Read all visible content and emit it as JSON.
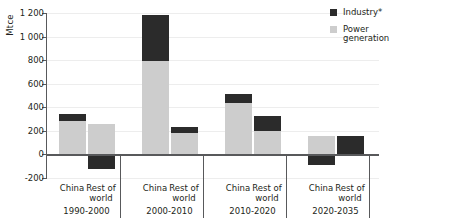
{
  "chart_data": {
    "type": "bar",
    "title": "",
    "subtitle": "",
    "xlabel": "",
    "ylabel": "Mtce",
    "ylim": [
      -200,
      1200
    ],
    "ytick_values": [
      -200,
      0,
      200,
      400,
      600,
      800,
      1000,
      1200
    ],
    "ytick_labels": [
      "-200",
      "0",
      "200",
      "400",
      "600",
      "800",
      "1 000",
      "1 200"
    ],
    "grid": true,
    "stacked": true,
    "legend_position": "top-right",
    "legend": [
      "Industry*",
      "Power generation"
    ],
    "colors": {
      "industry": "#2b2b2b",
      "power_generation": "#cdcdcd",
      "axis": "#58595b",
      "gridline": "#ededed",
      "background": "#ffffff"
    },
    "series": [
      {
        "name": "Power generation",
        "color": "#cdcdcd",
        "values": [
          280,
          255,
          790,
          185,
          440,
          200,
          160,
          0
        ]
      },
      {
        "name": "Industry*",
        "color": "#2b2b2b",
        "values": [
          60,
          -125,
          390,
          50,
          70,
          130,
          -90,
          160
        ]
      }
    ],
    "categories": [
      "China",
      "Rest of world",
      "China",
      "Rest of world",
      "China",
      "Rest of world",
      "China",
      "Rest of world"
    ],
    "groups": [
      {
        "period": "1990-2000",
        "bars": [
          {
            "label": "China",
            "power_generation": 280,
            "industry": 60,
            "total": 340
          },
          {
            "label": "Rest of world",
            "power_generation": 255,
            "industry": -125,
            "total": 130
          }
        ]
      },
      {
        "period": "2000-2010",
        "bars": [
          {
            "label": "China",
            "power_generation": 790,
            "industry": 390,
            "total": 1180
          },
          {
            "label": "Rest of world",
            "power_generation": 185,
            "industry": 50,
            "total": 235
          }
        ]
      },
      {
        "period": "2010-2020",
        "bars": [
          {
            "label": "China",
            "power_generation": 440,
            "industry": 70,
            "total": 510
          },
          {
            "label": "Rest of world",
            "power_generation": 200,
            "industry": 130,
            "total": 330
          }
        ]
      },
      {
        "period": "2020-2035",
        "bars": [
          {
            "label": "China",
            "power_generation": 160,
            "industry": -90,
            "total": 70
          },
          {
            "label": "Rest of world",
            "power_generation": 0,
            "industry": 160,
            "total": 160
          }
        ]
      }
    ]
  },
  "axis": {
    "y_title": "Mtce",
    "ticks": [
      {
        "value": 1200,
        "label": "1 200"
      },
      {
        "value": 1000,
        "label": "1 000"
      },
      {
        "value": 800,
        "label": "800"
      },
      {
        "value": 600,
        "label": "600"
      },
      {
        "value": 400,
        "label": "400"
      },
      {
        "value": 200,
        "label": "200"
      },
      {
        "value": 0,
        "label": "0"
      },
      {
        "value": -200,
        "label": "-200"
      }
    ]
  },
  "legend": {
    "items": [
      {
        "label": "Industry*",
        "color": "#2b2b2b"
      },
      {
        "label": "Power generation",
        "color": "#cdcdcd",
        "line1": "Power",
        "line2": "generation"
      }
    ]
  },
  "category_labels": {
    "china": "China",
    "rest_of_world_line1": "Rest of",
    "rest_of_world_line2": "world"
  },
  "period_labels": [
    "1990-2000",
    "2000-2010",
    "2010-2020",
    "2020-2035"
  ]
}
